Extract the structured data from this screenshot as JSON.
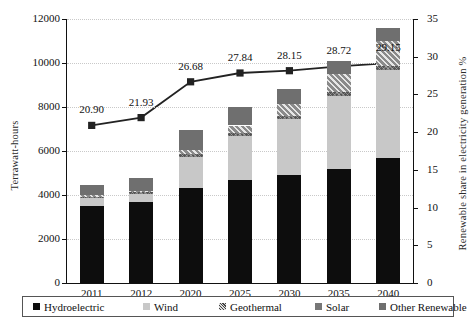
{
  "chart_data": {
    "type": "bar",
    "title": "",
    "categories": [
      "2011",
      "2012",
      "2020",
      "2025",
      "2030",
      "2035",
      "2040"
    ],
    "xlabel": "",
    "ylabel": "Terrawatt-hours",
    "y2label": "Renewable share in electricity generation %",
    "ylim": [
      0,
      12000
    ],
    "y2lim": [
      0,
      35
    ],
    "yticks": [
      0,
      2000,
      4000,
      6000,
      8000,
      10000,
      12000
    ],
    "y2ticks": [
      0,
      5,
      10,
      15,
      20,
      25,
      30,
      35
    ],
    "grid": true,
    "stacked": true,
    "legend_position": "bottom",
    "series": [
      {
        "name": "Hydroelectric",
        "type": "bar",
        "axis": "left",
        "values": [
          3500,
          3680,
          4320,
          4700,
          4900,
          5180,
          5680
        ]
      },
      {
        "name": "Wind",
        "type": "bar",
        "axis": "left",
        "values": [
          350,
          360,
          1430,
          2000,
          2550,
          3320,
          4000
        ]
      },
      {
        "name": "Geothermal",
        "type": "bar",
        "axis": "left",
        "values": [
          70,
          75,
          120,
          140,
          160,
          180,
          200
        ]
      },
      {
        "name": "Solar",
        "type": "bar",
        "axis": "left",
        "values": [
          60,
          70,
          180,
          320,
          520,
          800,
          1100
        ]
      },
      {
        "name": "Other Renewable",
        "type": "bar",
        "axis": "left",
        "values": [
          470,
          575,
          900,
          840,
          670,
          620,
          620
        ]
      },
      {
        "name": "Renewable share",
        "type": "line",
        "axis": "right",
        "values": [
          20.9,
          21.93,
          26.68,
          27.84,
          28.15,
          28.72,
          29.15
        ],
        "labels": [
          "20.90",
          "21.93",
          "26.68",
          "27.84",
          "28.15",
          "28.72",
          "29.15"
        ]
      }
    ],
    "totals": [
      4450,
      4760,
      6950,
      8000,
      8800,
      10100,
      11600
    ],
    "colors": {
      "Hydroelectric": "#0d0d0d",
      "Wind": "#c8c8c8",
      "Geothermal": "#555555",
      "Solar": "#9a9a9a",
      "Other Renewable": "#6f6f6f",
      "line": "#222222",
      "grid": "#c9c9c9",
      "axis": "#111111"
    }
  },
  "legend": {
    "items": [
      {
        "label": "Hydroelectric"
      },
      {
        "label": "Wind"
      },
      {
        "label": "Geothermal"
      },
      {
        "label": "Solar"
      },
      {
        "label": "Other Renewable"
      }
    ]
  }
}
